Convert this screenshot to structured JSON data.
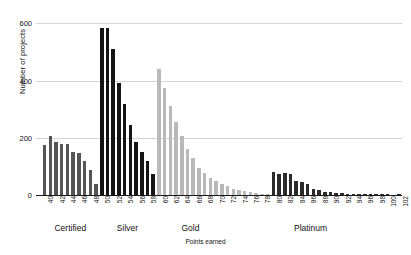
{
  "chart_data": {
    "type": "bar",
    "title": "",
    "xlabel": "Points earned",
    "ylabel": "Number of projects",
    "ylim": [
      0,
      640
    ],
    "yticks": [
      0,
      200,
      400,
      600
    ],
    "grid": "horizontal",
    "legend": "none",
    "xlim": [
      39,
      103
    ],
    "categories": [
      40,
      41,
      42,
      43,
      44,
      45,
      46,
      47,
      48,
      49,
      50,
      51,
      52,
      53,
      54,
      55,
      56,
      57,
      58,
      59,
      60,
      61,
      62,
      63,
      64,
      65,
      66,
      67,
      68,
      69,
      70,
      71,
      72,
      73,
      74,
      75,
      76,
      77,
      78,
      79,
      80,
      81,
      82,
      83,
      84,
      85,
      86,
      87,
      88,
      89,
      90,
      91,
      92,
      93,
      94,
      95,
      96,
      97,
      98,
      99,
      100,
      101,
      102
    ],
    "xtick_labels": [
      "40",
      "42",
      "44",
      "46",
      "48",
      "50",
      "52",
      "54",
      "56",
      "58",
      "60",
      "62",
      "64",
      "66",
      "68",
      "70",
      "72",
      "74",
      "76",
      "78",
      "80",
      "82",
      "84",
      "86",
      "88",
      "90",
      "92",
      "94",
      "96",
      "98",
      "100",
      "102"
    ],
    "values": [
      175,
      205,
      185,
      180,
      178,
      150,
      148,
      120,
      88,
      38,
      585,
      585,
      510,
      390,
      320,
      245,
      185,
      150,
      118,
      72,
      440,
      375,
      310,
      255,
      205,
      160,
      128,
      95,
      78,
      60,
      48,
      38,
      30,
      22,
      18,
      14,
      10,
      8,
      5,
      3,
      80,
      72,
      78,
      75,
      48,
      45,
      40,
      22,
      18,
      12,
      10,
      8,
      6,
      4,
      3,
      2,
      2,
      1,
      1,
      1,
      1,
      0,
      1
    ],
    "groups": [
      {
        "name": "Certified",
        "color": "#555555",
        "start": 40,
        "end": 49,
        "label_x": 44.5
      },
      {
        "name": "Silver",
        "color": "#151515",
        "start": 50,
        "end": 59,
        "label_x": 54.5
      },
      {
        "name": "Gold",
        "color": "#b9b9b9",
        "start": 60,
        "end": 79,
        "label_x": 65.5
      },
      {
        "name": "Platinum",
        "color": "#2b2b2b",
        "start": 80,
        "end": 102,
        "label_x": 86.5
      }
    ]
  }
}
